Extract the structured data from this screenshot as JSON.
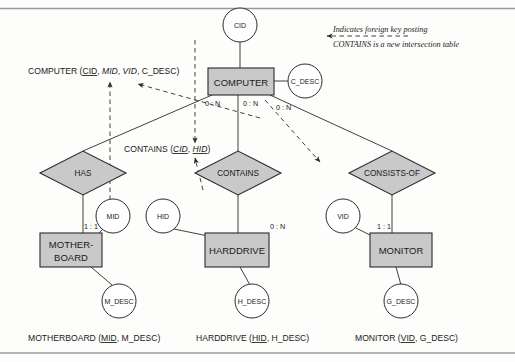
{
  "diagram": {
    "colors": {
      "entity_fill": "#c9c9c9",
      "diamond_fill": "#c9c9c9",
      "attribute_fill": "#ffffff",
      "stroke": "#2b2b2b",
      "background": "#fdfdfc",
      "rule": "#9a9aa0"
    },
    "entities": [
      {
        "name": "COMPUTER",
        "label": "COMPUTER",
        "x": 208,
        "y": 68,
        "w": 66,
        "h": 27
      },
      {
        "name": "MOTHERBOARD",
        "label_line1": "MOTHER-",
        "label_line2": "BOARD",
        "x": 40,
        "y": 233,
        "w": 62,
        "h": 34
      },
      {
        "name": "HARDDRIVE",
        "label": "HARDDRIVE",
        "x": 205,
        "y": 233,
        "w": 64,
        "h": 34
      },
      {
        "name": "MONITOR",
        "label": "MONITOR",
        "x": 370,
        "y": 233,
        "w": 62,
        "h": 34
      }
    ],
    "relationships": [
      {
        "name": "HAS",
        "label": "HAS",
        "cx": 83,
        "cy": 173,
        "rx": 43,
        "ry": 22
      },
      {
        "name": "CONTAINS",
        "label": "CONTAINS",
        "cx": 238,
        "cy": 173,
        "rx": 43,
        "ry": 22
      },
      {
        "name": "CONSISTS-OF",
        "label": "CONSISTS-OF",
        "cx": 392,
        "cy": 173,
        "rx": 43,
        "ry": 22
      }
    ],
    "attributes": [
      {
        "name": "CID",
        "label": "CID",
        "cx": 240,
        "cy": 25,
        "r": 17
      },
      {
        "name": "C_DESC",
        "label": "C_DESC",
        "cx": 305,
        "cy": 81,
        "r": 17
      },
      {
        "name": "MID",
        "label": "MID",
        "cx": 113,
        "cy": 216,
        "r": 17
      },
      {
        "name": "HID",
        "label": "HID",
        "cx": 163,
        "cy": 216,
        "r": 17
      },
      {
        "name": "VID",
        "label": "VID",
        "cx": 343,
        "cy": 216,
        "r": 17
      },
      {
        "name": "M_DESC",
        "label": "M_DESC",
        "cx": 119,
        "cy": 301,
        "r": 17
      },
      {
        "name": "H_DESC",
        "label": "H_DESC",
        "cx": 252,
        "cy": 301,
        "r": 17
      },
      {
        "name": "G_DESC",
        "label": "G_DESC",
        "cx": 401,
        "cy": 301,
        "r": 17
      }
    ],
    "cardinalities": [
      {
        "name": "computer-has",
        "label": "0 : N",
        "x": 205,
        "y": 106
      },
      {
        "name": "computer-contains",
        "label": "0 : N",
        "x": 243,
        "y": 106
      },
      {
        "name": "computer-consists-of",
        "label": "0 : N",
        "x": 276,
        "y": 110
      },
      {
        "name": "motherboard-has",
        "label": "1 : 1",
        "x": 84,
        "y": 229
      },
      {
        "name": "harddrive-contains",
        "label": "0 : N",
        "x": 270,
        "y": 229
      },
      {
        "name": "monitor-consists-of",
        "label": "1 : 1",
        "x": 377,
        "y": 229
      }
    ],
    "relation_schemas": [
      {
        "name": "computer-relation",
        "x": 28,
        "y": 74,
        "parts": [
          {
            "text": "COMPUTER (",
            "style": "plain"
          },
          {
            "text": "CID",
            "style": "underline"
          },
          {
            "text": ", ",
            "style": "plain"
          },
          {
            "text": "MID",
            "style": "italic"
          },
          {
            "text": ", ",
            "style": "plain"
          },
          {
            "text": "VID",
            "style": "italic"
          },
          {
            "text": ", C_DESC)",
            "style": "plain"
          }
        ]
      },
      {
        "name": "contains-relation",
        "x": 124,
        "y": 152,
        "parts": [
          {
            "text": "CONTAINS (",
            "style": "plain"
          },
          {
            "text": "CID",
            "style": "italic-underline"
          },
          {
            "text": ", ",
            "style": "plain"
          },
          {
            "text": "HID",
            "style": "italic-underline"
          },
          {
            "text": ")",
            "style": "plain"
          }
        ]
      },
      {
        "name": "motherboard-relation",
        "x": 28,
        "y": 341,
        "parts": [
          {
            "text": "MOTHERBOARD (",
            "style": "plain"
          },
          {
            "text": "MID",
            "style": "underline"
          },
          {
            "text": ", M_DESC)",
            "style": "plain"
          }
        ]
      },
      {
        "name": "harddrive-relation",
        "x": 196,
        "y": 341,
        "parts": [
          {
            "text": "HARDDRIVE (",
            "style": "plain"
          },
          {
            "text": "HID",
            "style": "underline"
          },
          {
            "text": ", H_DESC)",
            "style": "plain"
          }
        ]
      },
      {
        "name": "monitor-relation",
        "x": 355,
        "y": 341,
        "parts": [
          {
            "text": "MONITOR (",
            "style": "plain"
          },
          {
            "text": "VID",
            "style": "underline"
          },
          {
            "text": ", G_DESC)",
            "style": "plain"
          }
        ]
      }
    ],
    "legend": {
      "line1": "Indicates foreign key posting",
      "line2": "CONTAINS is a new intersection table"
    }
  }
}
